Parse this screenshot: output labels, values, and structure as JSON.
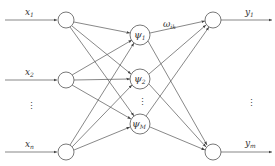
{
  "diagram": {
    "type": "neural-network",
    "layers": {
      "input": {
        "nodes": [
          {
            "label": "x",
            "sub": "1"
          },
          {
            "label": "x",
            "sub": "2"
          },
          {
            "label": "x",
            "sub": "n"
          }
        ],
        "ellipsis": "⋮"
      },
      "hidden": {
        "nodes": [
          {
            "label": "ψ",
            "sub": "1"
          },
          {
            "label": "ψ",
            "sub": "2"
          },
          {
            "label": "ψ",
            "sub": "M"
          }
        ],
        "ellipsis": "⋮"
      },
      "output": {
        "nodes": [
          {
            "label": "y",
            "sub": "1"
          },
          {
            "label": "y",
            "sub": "m"
          }
        ],
        "ellipsis": "⋮"
      }
    },
    "weight_label": {
      "label": "ω",
      "sub": "ik"
    },
    "colors": {
      "stroke": "#555555",
      "text": "#333333",
      "background": "#ffffff"
    }
  }
}
